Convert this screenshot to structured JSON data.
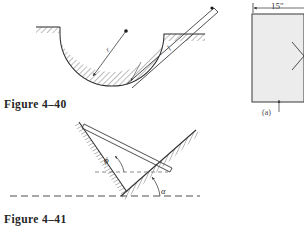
{
  "page": {
    "background_color": "#ffffff",
    "ink_color": "#2a2a2a",
    "hatch_color": "#6e6e6e"
  },
  "figures": [
    {
      "id": "figure-4-40",
      "caption": "Figure  4–40",
      "description": "Rod of length l resting in a hemispherical bowl of radius r",
      "labels": [
        {
          "name": "radius-label",
          "text": "r"
        },
        {
          "name": "rod-length-label",
          "text": "l"
        }
      ]
    },
    {
      "id": "figure-4-41",
      "caption": "Figure  4–41",
      "description": "Rod resting against two inclined hatched surfaces with angles phi and alpha",
      "labels": [
        {
          "name": "angle-phi-label",
          "text": "ϕ"
        },
        {
          "name": "angle-alpha-label",
          "text": "α"
        }
      ]
    },
    {
      "id": "figure-right-panel",
      "caption": "(a)",
      "description": "Partial square plate with 15 inch dimension and diamond cutout",
      "labels": [
        {
          "name": "dimension-15-inch-label",
          "text": "15″"
        },
        {
          "name": "subfigure-label",
          "text": "(a)"
        }
      ]
    }
  ]
}
